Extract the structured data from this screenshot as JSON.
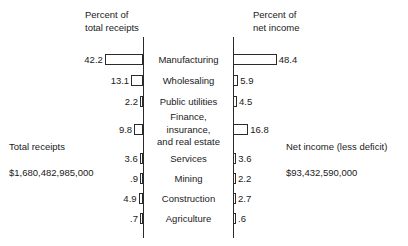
{
  "headers": {
    "left": "Percent of\ntotal receipts",
    "right": "Percent of\nnet income"
  },
  "totals": {
    "left_label": "Total receipts",
    "left_value": "$1,680,482,985,000",
    "right_label": "Net income (less deficit)",
    "right_value": "$93,432,590,000"
  },
  "chart_data": {
    "type": "bar",
    "title": "",
    "xlabel": "",
    "ylabel": "",
    "orientation": "horizontal-diverging",
    "grid": false,
    "legend": "none",
    "axis_note": "Two back-to-back horizontal bar axes; left bars grow leftward from the left spine, right bars grow rightward from the right spine.",
    "categories": [
      "Manufacturing",
      "Wholesaling",
      "Public utilities",
      "Finance,\ninsurance,\nand real estate",
      "Services",
      "Mining",
      "Construction",
      "Agriculture"
    ],
    "series": [
      {
        "name": "Percent of total receipts",
        "values": [
          42.2,
          13.1,
          2.2,
          9.8,
          3.6,
          0.9,
          4.9,
          0.7
        ],
        "labels": [
          "42.2",
          "13.1",
          "2.2",
          "9.8",
          "3.6",
          ".9",
          "4.9",
          ".7"
        ]
      },
      {
        "name": "Percent of net income",
        "values": [
          48.4,
          5.9,
          4.5,
          16.8,
          3.6,
          2.2,
          2.7,
          0.6
        ],
        "labels": [
          "48.4",
          "5.9",
          "4.5",
          "16.8",
          "3.6",
          "2.2",
          "2.7",
          ".6"
        ]
      }
    ],
    "xlim": [
      0,
      50
    ],
    "units": "percent"
  },
  "style": {
    "bar_fill": "#ffffff",
    "bar_stroke": "#2b2b2b",
    "text_color": "#1a1a1a",
    "background": "#ffffff"
  }
}
